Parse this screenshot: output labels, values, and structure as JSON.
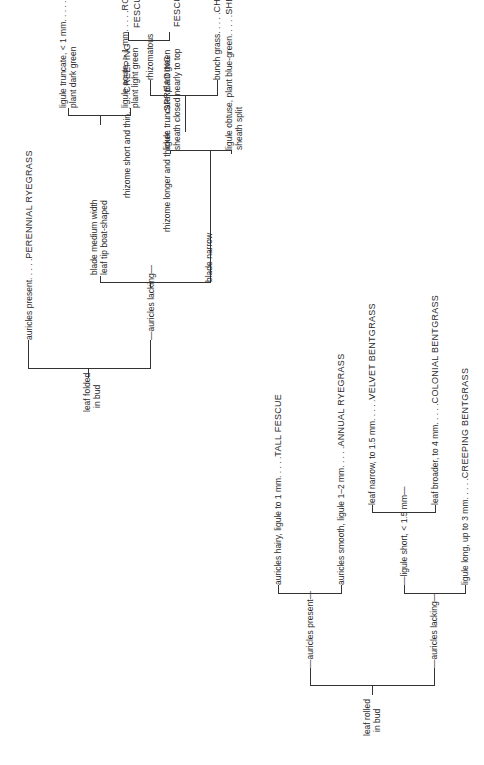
{
  "folded": {
    "root": "leaf folded in bud",
    "root_lines": [
      "leaf folded",
      "in bud"
    ],
    "auricles_present": "auricles present",
    "perennial": {
      "clue": "auricles present. . . . .",
      "species": "PERENNIAL RYEGRASS"
    },
    "auricles_lacking": "auricles lacking",
    "blade_medium": [
      "blade medium width",
      "leaf tip boat-shaped"
    ],
    "kentucky": {
      "clue": [
        "ligule truncate, < 1 mm. . . . .",
        "plant dark green"
      ],
      "species": "KENTUCKY BLUEGRASS"
    },
    "rough": {
      "clue": [
        "ligule acute, > 1 mm. . . . .",
        "plant light green"
      ],
      "species": "ROUGH BLUEGRASS"
    },
    "blade_narrow": "blade narrow",
    "plant_green": [
      "ligule truncate, plant green",
      "sheath closed nearly to top"
    ],
    "rhizomatous": "rhizomatous",
    "creeping_fescue": {
      "clue": "rhizome short and thin. . . . .",
      "species": [
        "CREEPING",
        "FESCUE"
      ]
    },
    "spreading_fescue": {
      "clue": "rhizome longer and thicker. . . . .",
      "species": [
        "SPREADING",
        "FESCUE"
      ]
    },
    "chewings": {
      "clue": "bunch grass. . . . .",
      "species": "CHEWINGS FESCUE"
    },
    "sheeps": {
      "clue": [
        "ligule obtuse, plant blue-green. . . . .",
        "sheath split"
      ],
      "species": "SHEEP'S FESCUE"
    }
  },
  "rolled": {
    "root_lines": [
      "leaf rolled",
      "in bud"
    ],
    "auricles_present": "auricles present",
    "tall_fescue": {
      "clue": "auricles hairy, ligule to 1 mm. . . . .",
      "species": "TALL FESCUE"
    },
    "annual": {
      "clue": "auricles smooth, ligule 1–2 mm. . . . .",
      "species": "ANNUAL RYEGRASS"
    },
    "auricles_lacking": "auricles lacking",
    "ligule_short": "ligule short, < 1.5 mm",
    "velvet": {
      "clue": "leaf narrow, to 1.5 mm. . . . .",
      "species": "VELVET BENTGRASS"
    },
    "colonial": {
      "clue": "leaf broader, to 4 mm. . . . .",
      "species": "COLONIAL BENTGRASS"
    },
    "creeping_bent": {
      "clue": "ligule long, up to 3 mm. . . . .",
      "species": "CREEPING BENTGRASS"
    }
  }
}
